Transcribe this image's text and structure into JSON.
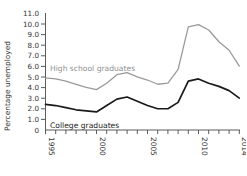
{
  "chart_data": {
    "type": "line",
    "title": "",
    "xlabel": "",
    "ylabel": "Percentage unemployed",
    "xlim": [
      1995,
      2014
    ],
    "ylim": [
      0,
      11
    ],
    "grid": false,
    "legend_position": "inline-annotations",
    "x": [
      1995,
      1996,
      1997,
      1998,
      1999,
      2000,
      2001,
      2002,
      2003,
      2004,
      2005,
      2006,
      2007,
      2008,
      2009,
      2010,
      2011,
      2012,
      2013,
      2014
    ],
    "series": [
      {
        "name": "High school graduates",
        "color": "#9a9a9a",
        "label_position": "inline",
        "values": [
          4.9,
          4.8,
          4.6,
          4.3,
          4.0,
          3.8,
          4.4,
          5.2,
          5.4,
          5.0,
          4.7,
          4.3,
          4.4,
          5.7,
          9.7,
          9.9,
          9.4,
          8.3,
          7.5,
          6.0
        ]
      },
      {
        "name": "College graduates",
        "color": "#1a1a1a",
        "label_position": "inline",
        "values": [
          2.4,
          2.3,
          2.1,
          1.9,
          1.8,
          1.7,
          2.3,
          2.9,
          3.1,
          2.7,
          2.3,
          2.0,
          2.0,
          2.6,
          4.6,
          4.8,
          4.4,
          4.1,
          3.7,
          3.0
        ]
      }
    ],
    "y_ticks": [
      "0",
      "1.0",
      "2.0",
      "3.0",
      "4.0",
      "5.0",
      "6.0",
      "7.0",
      "8.0",
      "9.0",
      "10.0",
      "11.0"
    ],
    "y_tick_values": [
      0,
      1,
      2,
      3,
      4,
      5,
      6,
      7,
      8,
      9,
      10,
      11
    ],
    "x_ticks_all": [
      1995,
      1996,
      1997,
      1998,
      1999,
      2000,
      2001,
      2002,
      2003,
      2004,
      2005,
      2006,
      2007,
      2008,
      2009,
      2010,
      2011,
      2012,
      2013,
      2014
    ],
    "x_tick_labels": [
      {
        "value": 1995,
        "label": "1995"
      },
      {
        "value": 2000,
        "label": "2000"
      },
      {
        "value": 2005,
        "label": "2005"
      },
      {
        "value": 2010,
        "label": "2010"
      },
      {
        "value": 2014,
        "label": "2014"
      }
    ]
  },
  "figure": {
    "y_axis_title": "Percentage unemployed",
    "annotation_high_school": "High school graduates",
    "annotation_college": "College graduates"
  }
}
